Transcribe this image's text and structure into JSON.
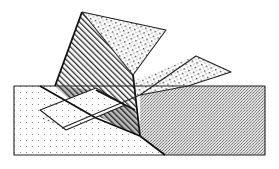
{
  "figure": {
    "title": "Overlapping patterned polygons",
    "fills": {
      "sparse_dots": "#888888",
      "hatch": "#333333",
      "coarse_dots": "#444444",
      "fine_stipple": "#9a9a9a",
      "outline": "#222222",
      "background": "#ffffff"
    },
    "shapes": [
      {
        "name": "base-rectangle",
        "texture": "sparse dots"
      },
      {
        "name": "stipple-region",
        "texture": "fine stipple"
      },
      {
        "name": "hatched-triangle",
        "texture": "diagonal hatching"
      },
      {
        "name": "top-dotted-quad",
        "texture": "coarse dots"
      },
      {
        "name": "diagonal-band",
        "texture": "coarse dots"
      },
      {
        "name": "white-parallelogram",
        "texture": "none"
      }
    ]
  }
}
